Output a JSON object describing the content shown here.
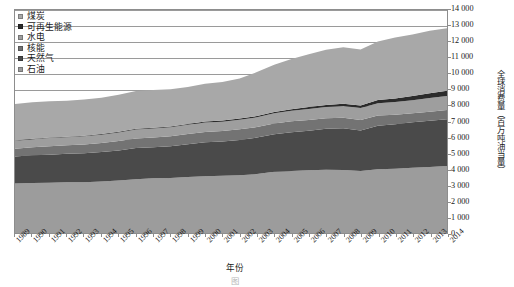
{
  "legend": {
    "position": "top-left",
    "items": [
      {
        "label": "煤炭",
        "key": "coal",
        "color": "#a8a8a8"
      },
      {
        "label": "可再生能源",
        "key": "renewables",
        "color": "#2b2b2b"
      },
      {
        "label": "水电",
        "key": "hydro",
        "color": "#9e9e9e"
      },
      {
        "label": "核能",
        "key": "nuclear",
        "color": "#737373"
      },
      {
        "label": "天然气",
        "key": "gas",
        "color": "#4a4a4a"
      },
      {
        "label": "石油",
        "key": "oil",
        "color": "#9c9c9c"
      }
    ]
  },
  "axes": {
    "y_title": "全球消费量（百万吨油当量）",
    "y_ticks": [
      "0",
      "1 000",
      "2 000",
      "3 000",
      "4 000",
      "5 000",
      "6 000",
      "7 000",
      "8 000",
      "9 000",
      "10 000",
      "11 000",
      "12 000",
      "13 000",
      "14 000"
    ],
    "x_title": "年份"
  },
  "caption": "图",
  "chart_data": {
    "type": "area",
    "stacked": true,
    "title": "",
    "xlabel": "年份",
    "ylabel": "全球消费量（百万吨油当量）",
    "ylim": [
      0,
      14000
    ],
    "ytick_step": 1000,
    "grid": true,
    "legend_position": "top-left",
    "x": [
      1989,
      1990,
      1991,
      1992,
      1993,
      1994,
      1995,
      1996,
      1997,
      1998,
      1999,
      2000,
      2001,
      2002,
      2003,
      2004,
      2005,
      2006,
      2007,
      2008,
      2009,
      2010,
      2011,
      2012,
      2013,
      2014
    ],
    "stack_order_bottom_to_top": [
      "石油",
      "天然气",
      "核能",
      "水电",
      "可再生能源",
      "煤炭"
    ],
    "series": [
      {
        "name": "石油",
        "key": "oil",
        "color": "#9c9c9c",
        "values": [
          3100,
          3140,
          3150,
          3180,
          3180,
          3240,
          3290,
          3370,
          3430,
          3450,
          3520,
          3570,
          3590,
          3620,
          3700,
          3840,
          3900,
          3940,
          3970,
          3960,
          3890,
          4000,
          4040,
          4100,
          4150,
          4210
        ]
      },
      {
        "name": "天然气",
        "key": "gas",
        "color": "#4a4a4a",
        "values": [
          1700,
          1740,
          1770,
          1790,
          1820,
          1840,
          1890,
          1960,
          1960,
          2000,
          2050,
          2120,
          2160,
          2220,
          2290,
          2360,
          2430,
          2480,
          2570,
          2610,
          2550,
          2730,
          2790,
          2850,
          2900,
          2930
        ]
      },
      {
        "name": "核能",
        "key": "nuclear",
        "color": "#737373",
        "values": [
          490,
          510,
          530,
          540,
          550,
          570,
          590,
          610,
          610,
          620,
          640,
          650,
          660,
          670,
          660,
          680,
          680,
          680,
          670,
          670,
          650,
          640,
          600,
          560,
          570,
          580
        ]
      },
      {
        "name": "水电",
        "key": "hydro",
        "color": "#9e9e9e",
        "values": [
          490,
          500,
          510,
          500,
          520,
          520,
          540,
          560,
          560,
          570,
          580,
          590,
          580,
          600,
          610,
          630,
          660,
          690,
          700,
          730,
          750,
          780,
          790,
          830,
          860,
          880
        ]
      },
      {
        "name": "可再生能源",
        "key": "renewables",
        "color": "#2b2b2b",
        "values": [
          30,
          32,
          34,
          36,
          38,
          41,
          44,
          47,
          50,
          54,
          58,
          63,
          68,
          74,
          81,
          90,
          100,
          113,
          129,
          148,
          168,
          196,
          228,
          262,
          295,
          330
        ]
      },
      {
        "name": "煤炭",
        "key": "coal",
        "color": "#a8a8a8",
        "values": [
          2290,
          2290,
          2280,
          2260,
          2270,
          2280,
          2320,
          2360,
          2360,
          2330,
          2320,
          2370,
          2420,
          2520,
          2760,
          2970,
          3150,
          3320,
          3470,
          3540,
          3520,
          3670,
          3830,
          3860,
          3930,
          3930
        ]
      }
    ],
    "totals": [
      8100,
      8212,
      8274,
      8306,
      8378,
      8491,
      8674,
      8907,
      8970,
      9024,
      9168,
      9363,
      9478,
      9704,
      10101,
      10570,
      10920,
      11223,
      11509,
      11658,
      11478,
      12016,
      12278,
      12462,
      12705,
      12860
    ]
  }
}
